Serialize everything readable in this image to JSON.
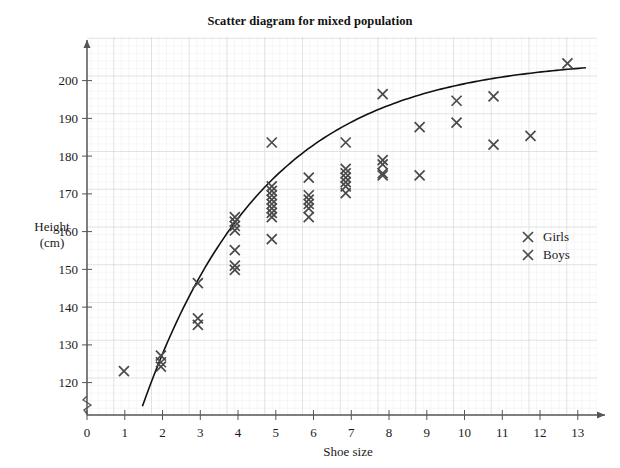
{
  "chart_data": {
    "type": "scatter",
    "title": "Scatter diagram for mixed population",
    "xlabel": "Shoe size",
    "ylabel": "Height",
    "ylabel_units": "(cm)",
    "xlim": [
      0,
      13.8
    ],
    "ylim": [
      118,
      204
    ],
    "xticks": [
      0,
      1,
      2,
      3,
      4,
      5,
      6,
      7,
      8,
      9,
      10,
      11,
      12,
      13
    ],
    "yticks": [
      120,
      130,
      140,
      150,
      160,
      170,
      180,
      190,
      200
    ],
    "grid": true,
    "grid_minor_step_x": 0.2,
    "grid_minor_step_y": 2,
    "y_axis_break": true,
    "legend_position": "right-middle",
    "legend": [
      {
        "label": "Girls",
        "marker": "x",
        "color": "#4a4a4a"
      },
      {
        "label": "Boys",
        "marker": "x",
        "color": "#4a4a4a"
      }
    ],
    "marker_color": "#4a4a4a",
    "curve_color": "#111111",
    "points": [
      [
        1,
        128
      ],
      [
        2,
        129
      ],
      [
        2,
        130
      ],
      [
        2,
        131.5
      ],
      [
        3,
        148
      ],
      [
        3,
        140
      ],
      [
        3,
        138.5
      ],
      [
        4,
        163
      ],
      [
        4,
        162
      ],
      [
        4,
        161
      ],
      [
        4,
        160
      ],
      [
        4,
        155.5
      ],
      [
        4,
        152
      ],
      [
        4,
        151
      ],
      [
        5,
        180
      ],
      [
        5,
        170
      ],
      [
        5,
        169
      ],
      [
        5,
        168
      ],
      [
        5,
        167
      ],
      [
        5,
        166
      ],
      [
        5,
        165
      ],
      [
        5,
        164
      ],
      [
        5,
        163
      ],
      [
        5,
        158
      ],
      [
        6,
        172
      ],
      [
        6,
        168
      ],
      [
        6,
        167
      ],
      [
        6,
        166
      ],
      [
        6,
        165
      ],
      [
        6,
        163
      ],
      [
        7,
        180
      ],
      [
        7,
        174
      ],
      [
        7,
        173
      ],
      [
        7,
        172
      ],
      [
        7,
        171
      ],
      [
        7,
        170
      ],
      [
        7,
        168.5
      ],
      [
        8,
        191
      ],
      [
        8,
        176
      ],
      [
        8,
        175
      ],
      [
        8,
        173
      ],
      [
        8,
        172.5
      ],
      [
        9,
        183.5
      ],
      [
        9,
        172.5
      ],
      [
        10,
        189.5
      ],
      [
        10,
        184.5
      ],
      [
        11,
        190.5
      ],
      [
        11,
        179.5
      ],
      [
        12,
        181.5
      ],
      [
        13,
        198
      ]
    ],
    "trend_curve": {
      "type": "curve-of-best-fit",
      "x_start": 1.5,
      "x_end": 13.5,
      "y_start": 120,
      "y_end": 197
    }
  }
}
